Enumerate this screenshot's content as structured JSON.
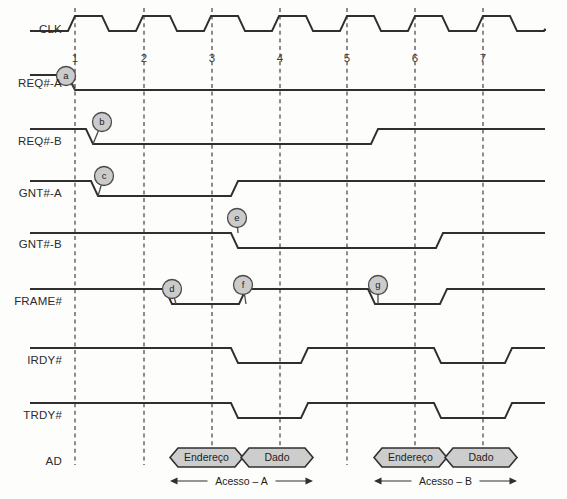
{
  "geometry": {
    "width": 567,
    "height": 499,
    "label_x": 62,
    "wave_start_x": 30,
    "wave_end_x": 545,
    "cycle_x": [
      75,
      144,
      212,
      280,
      347,
      415,
      483
    ],
    "grid_top": 8,
    "grid_bottom": 465,
    "edge_slope": 7,
    "wave_amplitude": 15
  },
  "clock": {
    "label": "CLK",
    "label_y": 33,
    "high_y": 16,
    "low_y": 31,
    "cycles": 7,
    "period": 68,
    "duty": 0.5,
    "note": "trapezoidal clock, rising edge just before each numbered gridline"
  },
  "cycle_numbers": {
    "labels": [
      "1",
      "2",
      "3",
      "4",
      "5",
      "6",
      "7"
    ],
    "y": 62
  },
  "signals": [
    {
      "name": "REQ#-A",
      "label_y": 87,
      "high_y": 75,
      "low_y": 90,
      "initial": "high",
      "transitions": [
        {
          "x": 75,
          "to": "low"
        }
      ]
    },
    {
      "name": "REQ#-B",
      "label_y": 145,
      "high_y": 129,
      "low_y": 144,
      "initial": "high",
      "transitions": [
        {
          "x": 93,
          "to": "low"
        },
        {
          "x": 378,
          "to": "high"
        }
      ]
    },
    {
      "name": "GNT#-A",
      "label_y": 197,
      "high_y": 181,
      "low_y": 196,
      "initial": "high",
      "transitions": [
        {
          "x": 98,
          "to": "low"
        },
        {
          "x": 238,
          "to": "high"
        }
      ]
    },
    {
      "name": "GNT#-B",
      "label_y": 248,
      "high_y": 233,
      "low_y": 248,
      "initial": "high",
      "transitions": [
        {
          "x": 238,
          "to": "low"
        },
        {
          "x": 443,
          "to": "high"
        }
      ]
    },
    {
      "name": "FRAME#",
      "label_y": 305,
      "high_y": 289,
      "low_y": 304,
      "initial": "high",
      "transitions": [
        {
          "x": 172,
          "to": "low"
        },
        {
          "x": 246,
          "to": "high"
        },
        {
          "x": 375,
          "to": "low"
        },
        {
          "x": 447,
          "to": "high"
        }
      ]
    },
    {
      "name": "IRDY#",
      "label_y": 364,
      "high_y": 348,
      "low_y": 363,
      "initial": "high",
      "transitions": [
        {
          "x": 238,
          "to": "low"
        },
        {
          "x": 308,
          "to": "high"
        },
        {
          "x": 441,
          "to": "low"
        },
        {
          "x": 512,
          "to": "high"
        }
      ]
    },
    {
      "name": "TRDY#",
      "label_y": 419,
      "high_y": 403,
      "low_y": 418,
      "initial": "high",
      "transitions": [
        {
          "x": 238,
          "to": "low"
        },
        {
          "x": 308,
          "to": "high"
        },
        {
          "x": 441,
          "to": "low"
        },
        {
          "x": 512,
          "to": "high"
        }
      ]
    }
  ],
  "bus": {
    "name": "AD",
    "label_y": 465,
    "packet_top": 448,
    "packet_bottom": 467,
    "packets": [
      {
        "label": "Endereço",
        "x1": 170,
        "x2": 243
      },
      {
        "label": "Dado",
        "x1": 241,
        "x2": 313
      },
      {
        "label": "Endereço",
        "x1": 374,
        "x2": 447
      },
      {
        "label": "Dado",
        "x1": 445,
        "x2": 517
      }
    ]
  },
  "spans": [
    {
      "label": "Acesso – A",
      "x1": 170,
      "x2": 313,
      "y": 481
    },
    {
      "label": "Acesso – B",
      "x1": 374,
      "x2": 517,
      "y": 481
    }
  ],
  "annotations": [
    {
      "id": "a",
      "cx": 66,
      "cy": 76,
      "r": 9.5,
      "tail_x": 75,
      "tail_y": 90
    },
    {
      "id": "b",
      "cx": 102,
      "cy": 122,
      "r": 9.5,
      "tail_x": 93,
      "tail_y": 144
    },
    {
      "id": "c",
      "cx": 104,
      "cy": 176,
      "r": 9.5,
      "tail_x": 98,
      "tail_y": 196
    },
    {
      "id": "e",
      "cx": 237,
      "cy": 218,
      "r": 9.5,
      "tail_x": 238,
      "tail_y": 233
    },
    {
      "id": "d",
      "cx": 172,
      "cy": 289,
      "r": 9.5,
      "tail_x": 176,
      "tail_y": 304
    },
    {
      "id": "f",
      "cx": 243,
      "cy": 285,
      "r": 9.5,
      "tail_x": 246,
      "tail_y": 304
    },
    {
      "id": "g",
      "cx": 378,
      "cy": 285,
      "r": 9.5,
      "tail_x": 378,
      "tail_y": 304
    }
  ]
}
